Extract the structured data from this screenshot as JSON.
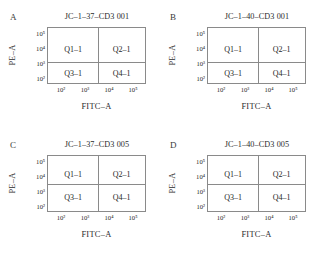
{
  "figure": {
    "clipped_header_text": "",
    "panel_count": 4
  },
  "chart_data": [
    {
      "type": "scatter",
      "panel_letter": "A",
      "title": "JC–1–37–CD3 001",
      "xlabel": "FITC–A",
      "ylabel": "PE–A",
      "xticks": [
        "10²",
        "10³",
        "10⁴",
        "10⁵"
      ],
      "yticks": [
        "10⁵",
        "10⁴",
        "10³",
        "10²"
      ],
      "xlim": [
        "10²",
        "10⁵"
      ],
      "ylim": [
        "10²",
        "10⁵"
      ],
      "grid": false,
      "legend": "none",
      "gate_x_frac": 0.52,
      "gate_y_frac": 0.62,
      "quadrants": [
        {
          "name": "Q1-1",
          "label": "Q1–1",
          "position": "top-left"
        },
        {
          "name": "Q2-1",
          "label": "Q2–1",
          "position": "top-right"
        },
        {
          "name": "Q3-1",
          "label": "Q3–1",
          "position": "bottom-left"
        },
        {
          "name": "Q4-1",
          "label": "Q4–1",
          "position": "bottom-right"
        }
      ],
      "points": []
    },
    {
      "type": "scatter",
      "panel_letter": "B",
      "title": "JC–1–40–CD3 001",
      "xlabel": "FITC–A",
      "ylabel": "PE–A",
      "xticks": [
        "10²",
        "10³",
        "10⁴",
        "10⁵"
      ],
      "yticks": [
        "10⁵",
        "10⁴",
        "10³",
        "10²"
      ],
      "xlim": [
        "10²",
        "10⁵"
      ],
      "ylim": [
        "10²",
        "10⁵"
      ],
      "grid": false,
      "legend": "none",
      "gate_x_frac": 0.52,
      "gate_y_frac": 0.62,
      "quadrants": [
        {
          "name": "Q1-1",
          "label": "Q1–1",
          "position": "top-left"
        },
        {
          "name": "Q2-1",
          "label": "Q2–1",
          "position": "top-right"
        },
        {
          "name": "Q3-1",
          "label": "Q3–1",
          "position": "bottom-left"
        },
        {
          "name": "Q4-1",
          "label": "Q4–1",
          "position": "bottom-right"
        }
      ],
      "points": []
    },
    {
      "type": "scatter",
      "panel_letter": "C",
      "title": "JC–1–37–CD3 005",
      "xlabel": "FITC–A",
      "ylabel": "PE–A",
      "xticks": [
        "10²",
        "10³",
        "10⁴",
        "10⁵"
      ],
      "yticks": [
        "10⁵",
        "10⁴",
        "10³",
        "10²"
      ],
      "xlim": [
        "10²",
        "10⁵"
      ],
      "ylim": [
        "10²",
        "10⁵"
      ],
      "grid": false,
      "legend": "none",
      "gate_x_frac": 0.52,
      "gate_y_frac": 0.5,
      "quadrants": [
        {
          "name": "Q1-1",
          "label": "Q1–1",
          "position": "top-left"
        },
        {
          "name": "Q2-1",
          "label": "Q2–1",
          "position": "top-right"
        },
        {
          "name": "Q3-1",
          "label": "Q3–1",
          "position": "bottom-left"
        },
        {
          "name": "Q4-1",
          "label": "Q4–1",
          "position": "bottom-right"
        }
      ],
      "points": []
    },
    {
      "type": "scatter",
      "panel_letter": "D",
      "title": "JC–1–40–CD3 005",
      "xlabel": "FITC–A",
      "ylabel": "PE–A",
      "xticks": [
        "10²",
        "10³",
        "10⁴",
        "10⁵"
      ],
      "yticks": [
        "10⁵",
        "10⁴",
        "10³",
        "10²"
      ],
      "xlim": [
        "10²",
        "10⁵"
      ],
      "ylim": [
        "10²",
        "10⁵"
      ],
      "grid": false,
      "legend": "none",
      "gate_x_frac": 0.52,
      "gate_y_frac": 0.5,
      "quadrants": [
        {
          "name": "Q1-1",
          "label": "Q1–1",
          "position": "top-left"
        },
        {
          "name": "Q2-1",
          "label": "Q2–1",
          "position": "top-right"
        },
        {
          "name": "Q3-1",
          "label": "Q3–1",
          "position": "bottom-left"
        },
        {
          "name": "Q4-1",
          "label": "Q4–1",
          "position": "bottom-right"
        }
      ],
      "points": []
    }
  ],
  "style": {
    "axis_color": "#8a8a8a",
    "text_color": "#1e1e1e",
    "background": "#ffffff"
  }
}
